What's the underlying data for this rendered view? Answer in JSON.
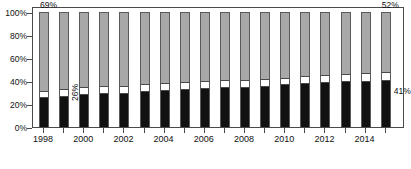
{
  "chart_data": {
    "type": "bar",
    "subtype": "100% stacked column",
    "title": "",
    "xlabel": "",
    "ylabel": "",
    "ylim": [
      0,
      100
    ],
    "ytick_labels": [
      "0%",
      "20%",
      "40%",
      "60%",
      "80%",
      "100%"
    ],
    "ytick_values": [
      0,
      20,
      40,
      60,
      80,
      100
    ],
    "grid": false,
    "legend": "none",
    "categories": [
      "1998",
      "1999",
      "2000",
      "2001",
      "2002",
      "2003",
      "2004",
      "2005",
      "2006",
      "2007",
      "2008",
      "2009",
      "2010",
      "2011",
      "2012",
      "2013",
      "2014",
      "2015"
    ],
    "xtick_labels_shown": [
      "1998",
      "",
      "2000",
      "",
      "2002",
      "",
      "2004",
      "",
      "2006",
      "",
      "2008",
      "",
      "2010",
      "",
      "2012",
      "",
      "2014",
      ""
    ],
    "series": [
      {
        "name": "bottom-black",
        "color": "#111111",
        "values": [
          26,
          27,
          29,
          30,
          30,
          31,
          32,
          33,
          34,
          35,
          35,
          36,
          37,
          38,
          39,
          40,
          40,
          41
        ]
      },
      {
        "name": "middle-white",
        "color": "#ffffff",
        "values": [
          5,
          6,
          6,
          6,
          6,
          6,
          6,
          6,
          6,
          6,
          6,
          6,
          6,
          6,
          6,
          6,
          7,
          7
        ]
      },
      {
        "name": "top-gray",
        "color": "#a8a8a8",
        "values": [
          69,
          67,
          65,
          64,
          64,
          63,
          62,
          61,
          60,
          59,
          59,
          58,
          57,
          56,
          55,
          54,
          53,
          52
        ]
      }
    ],
    "annotations": [
      {
        "text": "69%",
        "series": "top-gray",
        "category": "1998",
        "position": "above-bar"
      },
      {
        "text": "26%",
        "series": "bottom-black",
        "category": "1999",
        "position": "inside-rotated"
      },
      {
        "text": "52%",
        "series": "top-gray",
        "category": "2015",
        "position": "above-bar"
      },
      {
        "text": "41%",
        "series": "bottom-black",
        "category": "2015",
        "position": "right-of-bar"
      }
    ]
  }
}
